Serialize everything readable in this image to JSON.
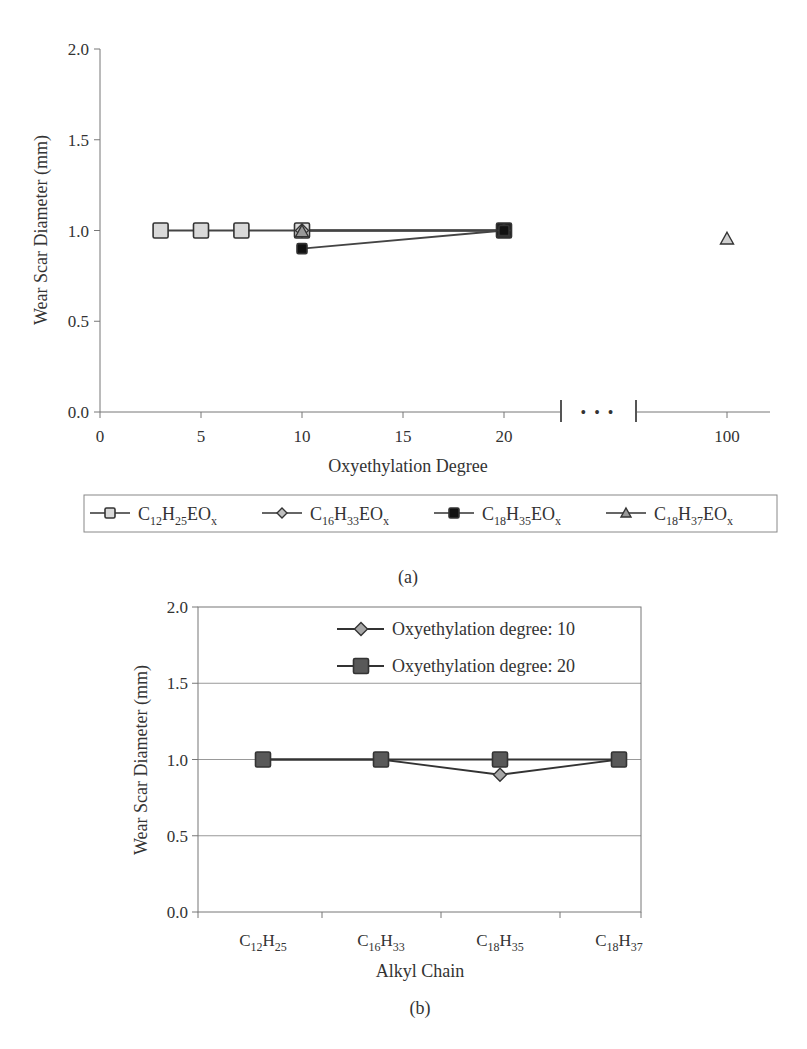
{
  "panel_a": {
    "caption": "(a)",
    "ylabel": "Wear Scar Diameter (mm)",
    "xlabel": "Oxyethylation Degree",
    "yticks": [
      "0.0",
      "0.5",
      "1.0",
      "1.5",
      "2.0"
    ],
    "xticks": [
      "0",
      "5",
      "10",
      "15",
      "20",
      "100"
    ],
    "axis_break": "• • •",
    "legend": [
      {
        "base": [
          [
            "C",
            "12"
          ],
          [
            "H",
            "25"
          ],
          [
            "EO",
            "x"
          ]
        ],
        "marker": "square",
        "fill": "#d9d9d9"
      },
      {
        "base": [
          [
            "C",
            "16"
          ],
          [
            "H",
            "33"
          ],
          [
            "EO",
            "x"
          ]
        ],
        "marker": "diamond",
        "fill": "#bfbfbf"
      },
      {
        "base": [
          [
            "C",
            "18"
          ],
          [
            "H",
            "35"
          ],
          [
            "EO",
            "x"
          ]
        ],
        "marker": "square",
        "fill": "#111111"
      },
      {
        "base": [
          [
            "C",
            "18"
          ],
          [
            "H",
            "37"
          ],
          [
            "EO",
            "x"
          ]
        ],
        "marker": "triangle",
        "fill": "#999999"
      }
    ]
  },
  "panel_b": {
    "caption": "(b)",
    "ylabel": "Wear Scar Diameter (mm)",
    "xlabel": "Alkyl Chain",
    "yticks": [
      "0.0",
      "0.5",
      "1.0",
      "1.5",
      "2.0"
    ],
    "categories": [
      [
        [
          "C",
          "12"
        ],
        [
          "H",
          "25"
        ]
      ],
      [
        [
          "C",
          "16"
        ],
        [
          "H",
          "33"
        ]
      ],
      [
        [
          "C",
          "18"
        ],
        [
          "H",
          "35"
        ]
      ],
      [
        [
          "C",
          "18"
        ],
        [
          "H",
          "37"
        ]
      ]
    ],
    "legend": [
      {
        "label": "Oxyethylation degree: 10",
        "marker": "diamond",
        "fill": "#a6a6a6"
      },
      {
        "label": "Oxyethylation degree: 20",
        "marker": "square",
        "fill": "#595959"
      }
    ]
  },
  "chart_data": [
    {
      "type": "line",
      "title": "(a)",
      "xlabel": "Oxyethylation Degree",
      "ylabel": "Wear Scar Diameter (mm)",
      "ylim": [
        0,
        2.0
      ],
      "xlim": [
        0,
        100
      ],
      "x_axis_break": [
        22,
        95
      ],
      "xticks": [
        0,
        5,
        10,
        15,
        20,
        100
      ],
      "yticks": [
        0.0,
        0.5,
        1.0,
        1.5,
        2.0
      ],
      "grid": false,
      "legend_position": "bottom",
      "series": [
        {
          "name": "C12H25EOx",
          "x": [
            3,
            5,
            7,
            10,
            20
          ],
          "y": [
            1.0,
            1.0,
            1.0,
            1.0,
            1.0
          ]
        },
        {
          "name": "C16H33EOx",
          "x": [
            10,
            20
          ],
          "y": [
            1.0,
            1.0
          ]
        },
        {
          "name": "C18H35EOx",
          "x": [
            10,
            20
          ],
          "y": [
            0.9,
            1.0
          ]
        },
        {
          "name": "C18H37EOx",
          "x": [
            10,
            20,
            100
          ],
          "y": [
            1.0,
            1.0,
            0.96
          ]
        }
      ]
    },
    {
      "type": "line",
      "title": "(b)",
      "xlabel": "Alkyl Chain",
      "ylabel": "Wear Scar Diameter (mm)",
      "ylim": [
        0,
        2.0
      ],
      "yticks": [
        0.0,
        0.5,
        1.0,
        1.5,
        2.0
      ],
      "grid": true,
      "legend_position": "top-right (inside)",
      "categories": [
        "C12H25",
        "C16H33",
        "C18H35",
        "C18H37"
      ],
      "series": [
        {
          "name": "Oxyethylation degree: 10",
          "values": [
            1.0,
            1.0,
            0.9,
            1.0
          ]
        },
        {
          "name": "Oxyethylation degree: 20",
          "values": [
            1.0,
            1.0,
            1.0,
            1.0
          ]
        }
      ]
    }
  ]
}
